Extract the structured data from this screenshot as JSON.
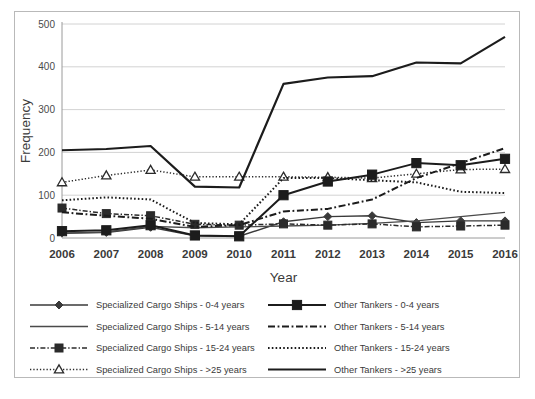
{
  "chart_data": {
    "type": "line",
    "title": "",
    "xlabel": "Year",
    "ylabel": "Frequency",
    "categories": [
      2006,
      2007,
      2008,
      2009,
      2010,
      2011,
      2012,
      2013,
      2014,
      2015,
      2016
    ],
    "x": [
      "2006",
      "2007",
      "2008",
      "2009",
      "2010",
      "2011",
      "2012",
      "2013",
      "2014",
      "2015",
      "2016"
    ],
    "ylim": [
      0,
      500
    ],
    "yticks": [
      0,
      100,
      200,
      300,
      400,
      500
    ],
    "ytick_labels": [
      "0",
      "100",
      "200",
      "300",
      "400",
      "500"
    ],
    "grid": true,
    "legend_position": "bottom",
    "series": [
      {
        "name": "Specialized Cargo Ships - 0-4 years",
        "key": "scs_0_4",
        "style": "solid",
        "marker": "diamond",
        "color": "#3a3a3a",
        "width": 1.4,
        "values": [
          12,
          13,
          25,
          5,
          4,
          38,
          50,
          52,
          36,
          40,
          40
        ]
      },
      {
        "name": "Specialized Cargo Ships - 5-14 years",
        "key": "scs_5_14",
        "style": "solid",
        "marker": "none",
        "color": "#4a4a4a",
        "width": 1.3,
        "values": [
          10,
          14,
          27,
          24,
          26,
          28,
          30,
          34,
          40,
          50,
          60
        ]
      },
      {
        "name": "Specialized Cargo Ships - 15-24 years",
        "key": "scs_15_24",
        "style": "dashdot",
        "marker": "square",
        "color": "#2b2b2b",
        "width": 1.5,
        "values": [
          70,
          57,
          52,
          32,
          30,
          33,
          30,
          33,
          26,
          28,
          30
        ]
      },
      {
        "name": "Specialized Cargo Ships - >25 years",
        "key": "scs_gt25",
        "style": "dotted",
        "marker": "triangle",
        "color": "#2b2b2b",
        "width": 1.5,
        "values": [
          130,
          146,
          159,
          143,
          143,
          143,
          142,
          140,
          150,
          160,
          161
        ]
      },
      {
        "name": "Other Tankers - 0-4 years",
        "key": "ot_0_4",
        "style": "solid",
        "marker": "filled-square",
        "color": "#1c1c1c",
        "width": 2.0,
        "values": [
          16,
          18,
          30,
          6,
          4,
          100,
          132,
          148,
          175,
          170,
          185
        ]
      },
      {
        "name": "Other Tankers - 5-14 years",
        "key": "ot_5_14",
        "style": "dashdot",
        "marker": "none",
        "color": "#1c1c1c",
        "width": 2.0,
        "values": [
          60,
          52,
          45,
          26,
          30,
          62,
          68,
          90,
          140,
          175,
          210
        ]
      },
      {
        "name": "Other Tankers - 15-24 years",
        "key": "ot_15_24",
        "style": "dotted",
        "marker": "none",
        "color": "#1c1c1c",
        "width": 2.0,
        "values": [
          88,
          95,
          90,
          35,
          32,
          140,
          140,
          135,
          130,
          108,
          105
        ]
      },
      {
        "name": "Other Tankers - >25 years",
        "key": "ot_gt25",
        "style": "solid",
        "marker": "none",
        "color": "#1c1c1c",
        "width": 2.2,
        "values": [
          205,
          208,
          215,
          120,
          118,
          360,
          375,
          378,
          410,
          408,
          470
        ]
      }
    ]
  },
  "legend": {
    "columns": [
      {
        "entries": [
          "Specialized Cargo Ships - 0-4 years",
          "Specialized Cargo Ships - 5-14 years",
          "Specialized Cargo Ships - 15-24 years",
          "Specialized Cargo Ships - >25 years"
        ],
        "keys": [
          "scs_0_4",
          "scs_5_14",
          "scs_15_24",
          "scs_gt25"
        ]
      },
      {
        "entries": [
          "Other Tankers - 0-4 years",
          "Other Tankers - 5-14 years",
          "Other Tankers - 15-24 years",
          "Other Tankers - >25 years"
        ],
        "keys": [
          "ot_0_4",
          "ot_5_14",
          "ot_15_24",
          "ot_gt25"
        ]
      }
    ]
  },
  "colors": {
    "line": "#1c1c1c",
    "grid": "#c6c6c6",
    "border": "#b9b9b9",
    "text": "#3a3a3a",
    "background": "#ffffff"
  }
}
